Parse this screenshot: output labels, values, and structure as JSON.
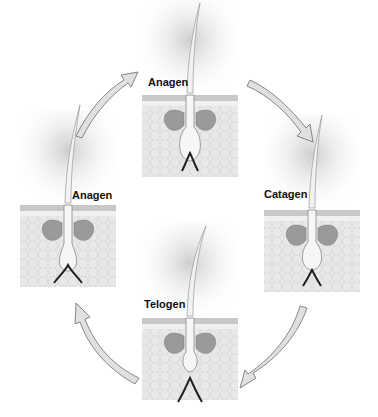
{
  "diagram": {
    "type": "cycle",
    "stages": [
      {
        "id": "anagen-top",
        "label": "Anagen",
        "position": "top"
      },
      {
        "id": "catagen",
        "label": "Catagen",
        "position": "right"
      },
      {
        "id": "telogen",
        "label": "Telogen",
        "position": "bottom"
      },
      {
        "id": "anagen-left",
        "label": "Anagen",
        "position": "left"
      }
    ],
    "arrows": [
      {
        "from": "anagen-top",
        "to": "catagen"
      },
      {
        "from": "catagen",
        "to": "telogen"
      },
      {
        "from": "telogen",
        "to": "anagen-left"
      },
      {
        "from": "anagen-left",
        "to": "anagen-top"
      }
    ],
    "colors": {
      "skin": "#e6e6e6",
      "skin_line": "#bdbdbd",
      "gland": "#9a9a9a",
      "hair": "#f4f4f4",
      "arrow_fill": "#e0e0e0",
      "arrow_stroke": "#7a7a7a"
    }
  }
}
